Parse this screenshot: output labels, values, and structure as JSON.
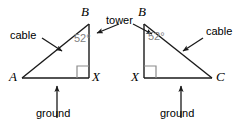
{
  "figure": {
    "colors": {
      "stroke": "#1a1a1a",
      "angle_text": "#808080",
      "right_angle_mark": "#8c8c8c",
      "background": "#ffffff",
      "label_text": "#000000"
    },
    "shared_labels": {
      "tower": "tower"
    },
    "left_triangle": {
      "name": "triangle-ABX",
      "vertices": [
        {
          "id": "A",
          "label": "A",
          "x": 22,
          "y": 78
        },
        {
          "id": "B",
          "label": "B",
          "x": 89,
          "y": 24
        },
        {
          "id": "X",
          "label": "X",
          "x": 89,
          "y": 78
        }
      ],
      "angle": {
        "label": "52°",
        "value": 52,
        "at_vertex": "B"
      },
      "right_angle_at": "X",
      "side_labels": {
        "hypotenuse": "cable",
        "base": "ground",
        "vertical": "tower"
      }
    },
    "right_triangle": {
      "name": "triangle-BXC",
      "vertices": [
        {
          "id": "B",
          "label": "B",
          "x": 144,
          "y": 24
        },
        {
          "id": "X",
          "label": "X",
          "x": 144,
          "y": 78
        },
        {
          "id": "C",
          "label": "C",
          "x": 212,
          "y": 78
        }
      ],
      "angle": {
        "label": "52°",
        "value": 52,
        "at_vertex": "B"
      },
      "right_angle_at": "X",
      "side_labels": {
        "hypotenuse": "cable",
        "base": "ground",
        "vertical": "tower"
      }
    }
  }
}
